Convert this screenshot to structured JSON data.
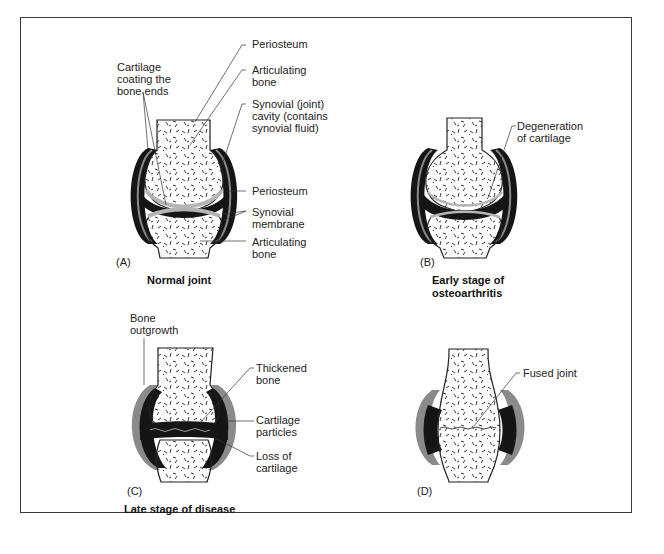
{
  "figure": {
    "panels": [
      {
        "id": "A",
        "letter": "(A)",
        "caption": "Normal joint",
        "labels": {
          "cartilage": "Cartilage\ncoating the\nbone ends",
          "periosteum_top": "Periosteum",
          "articulating_bone_top": "Articulating\nbone",
          "synovial_cavity": "Synovial (joint)\ncavity (contains\nsynovial fluid)",
          "periosteum_mid": "Periosteum",
          "synovial_membrane": "Synovial\nmembrane",
          "articulating_bone_bottom": "Articulating\nbone"
        }
      },
      {
        "id": "B",
        "letter": "(B)",
        "caption": "Early stage of\nosteoarthritis",
        "labels": {
          "degeneration": "Degeneration\nof cartilage"
        }
      },
      {
        "id": "C",
        "letter": "(C)",
        "caption": "Late stage of disease",
        "labels": {
          "bone_outgrowth": "Bone\noutgrowth",
          "thickened_bone": "Thickened\nbone",
          "cartilage_particles": "Cartilage\nparticles",
          "loss_of_cartilage": "Loss of\ncartilage"
        }
      },
      {
        "id": "D",
        "letter": "(D)",
        "caption": "",
        "labels": {
          "fused_joint": "Fused joint"
        }
      }
    ],
    "colors": {
      "frame": "#3a3a3a",
      "capsule_dark": "#151515",
      "capsule_gray": "#8a8a8a",
      "cartilage_gray": "#b5b5b5",
      "bone_fill": "#ffffff"
    }
  }
}
